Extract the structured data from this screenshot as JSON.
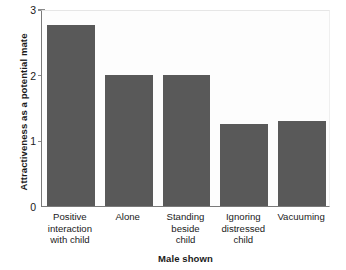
{
  "chart_data": {
    "type": "bar",
    "title": "",
    "subtitle": "",
    "xlabel": "Male shown",
    "ylabel": "Attractiveness as a potential mate",
    "categories": [
      "Positive interaction with child",
      "Alone",
      "Standing beside child",
      "Ignoring distressed child",
      "Vacuuming"
    ],
    "category_lines": [
      [
        "Positive",
        "interaction",
        "with child"
      ],
      [
        "Alone"
      ],
      [
        "Standing",
        "beside",
        "child"
      ],
      [
        "Ignoring",
        "distressed",
        "child"
      ],
      [
        "Vacuuming"
      ]
    ],
    "values": [
      2.75,
      2.0,
      2.0,
      1.25,
      1.3
    ],
    "ylim": [
      0,
      3
    ],
    "yticks": [
      0,
      1,
      2,
      3
    ],
    "ytick_labels": [
      "0",
      "1",
      "2",
      "3"
    ],
    "grid": false,
    "legend": null,
    "bar_color": "#595959",
    "axis_color": "#7a7a7a",
    "plot_background": "#fdfdfd",
    "figure_background": "#ffffff"
  }
}
